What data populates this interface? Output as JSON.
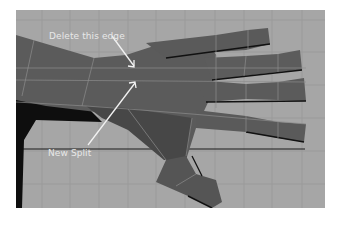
{
  "viewport": {
    "background": "#a6a6a6",
    "grid_color": "#999999",
    "mesh_color": "#5a5a5a",
    "edge_color": "#8a8a8a"
  },
  "annotations": {
    "delete_edge": "Delete this edge",
    "new_split": "New Split"
  }
}
